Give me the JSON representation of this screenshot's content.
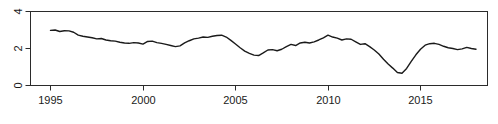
{
  "chart": {
    "type": "line",
    "title": "",
    "subtitle": "",
    "xlabel": "",
    "ylabel": "",
    "line_color": "#1a1a1a",
    "axis_color": "#2b2b2b",
    "background": "#ffffff",
    "grid": "off",
    "legend": "none",
    "box": "on"
  },
  "chart_data": {
    "type": "line",
    "title": "",
    "xlabel": "",
    "ylabel": "",
    "xlim": [
      1994.0,
      1994.0
    ],
    "ylim": [
      0,
      4
    ],
    "xticks": [
      1995,
      2000,
      2005,
      2010,
      2015
    ],
    "xtick_labels": [
      "1995",
      "2000",
      "2005",
      "2010",
      "2015"
    ],
    "yticks": [
      0,
      2,
      4
    ],
    "ytick_labels": [
      "0",
      "2",
      "4"
    ],
    "grid": false,
    "legend_position": "none",
    "series": [
      {
        "name": "series-1",
        "color": "#1a1a1a",
        "x": [
          1995.0,
          1995.25,
          1995.5,
          1995.75,
          1996.0,
          1996.25,
          1996.5,
          1996.75,
          1997.0,
          1997.25,
          1997.5,
          1997.75,
          1998.0,
          1998.25,
          1998.5,
          1998.75,
          1999.0,
          1999.25,
          1999.5,
          1999.75,
          2000.0,
          2000.25,
          2000.5,
          2000.75,
          2001.0,
          2001.25,
          2001.5,
          2001.75,
          2002.0,
          2002.25,
          2002.5,
          2002.75,
          2003.0,
          2003.25,
          2003.5,
          2003.75,
          2004.0,
          2004.25,
          2004.5,
          2004.75,
          2005.0,
          2005.25,
          2005.5,
          2005.75,
          2006.0,
          2006.25,
          2006.5,
          2006.75,
          2007.0,
          2007.25,
          2007.5,
          2007.75,
          2008.0,
          2008.25,
          2008.5,
          2008.75,
          2009.0,
          2009.25,
          2009.5,
          2009.75,
          2010.0,
          2010.25,
          2010.5,
          2010.75,
          2011.0,
          2011.25,
          2011.5,
          2011.75,
          2012.0,
          2012.25,
          2012.5,
          2012.75,
          2013.0,
          2013.25,
          2013.5,
          2013.75,
          2014.0,
          2014.25,
          2014.5,
          2014.75,
          2015.0,
          2015.25,
          2015.5,
          2015.75,
          2016.0,
          2016.25,
          2016.5,
          2016.75,
          2017.0,
          2017.25,
          2017.5,
          2017.75,
          2018.0
        ],
        "y": [
          2.98,
          3.0,
          2.92,
          2.96,
          2.95,
          2.88,
          2.72,
          2.66,
          2.62,
          2.58,
          2.52,
          2.54,
          2.46,
          2.42,
          2.4,
          2.34,
          2.3,
          2.28,
          2.32,
          2.3,
          2.24,
          2.38,
          2.4,
          2.32,
          2.28,
          2.22,
          2.16,
          2.1,
          2.14,
          2.3,
          2.42,
          2.52,
          2.56,
          2.62,
          2.6,
          2.66,
          2.7,
          2.72,
          2.62,
          2.44,
          2.24,
          2.04,
          1.86,
          1.74,
          1.64,
          1.62,
          1.76,
          1.92,
          1.94,
          1.88,
          1.96,
          2.1,
          2.22,
          2.16,
          2.3,
          2.34,
          2.3,
          2.36,
          2.46,
          2.58,
          2.72,
          2.62,
          2.56,
          2.46,
          2.52,
          2.5,
          2.36,
          2.22,
          2.26,
          2.1,
          1.92,
          1.7,
          1.42,
          1.16,
          0.94,
          0.7,
          0.66,
          0.92,
          1.3,
          1.66,
          1.96,
          2.18,
          2.26,
          2.28,
          2.22,
          2.12,
          2.04,
          2.0,
          1.94,
          1.98,
          2.06,
          2.0,
          1.96
        ]
      }
    ]
  },
  "axes": {
    "y_tick_labels": [
      "4",
      "2",
      "0"
    ],
    "x_tick_labels": [
      "1995",
      "2000",
      "2005",
      "2010",
      "2015"
    ]
  }
}
